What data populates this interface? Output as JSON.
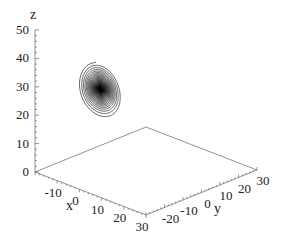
{
  "chart_data": {
    "type": "line3d",
    "title": "",
    "parameters": {
      "sigma": 10,
      "rho": 28,
      "beta": 2.6667
    },
    "axes": {
      "x": {
        "label": "x",
        "ticks": [
          "-10",
          "0",
          "10",
          "20",
          "30"
        ],
        "range": [
          -20,
          30
        ]
      },
      "y": {
        "label": "y",
        "ticks": [
          "-20",
          "-10",
          "0",
          "10",
          "20",
          "30"
        ],
        "range": [
          -30,
          30
        ]
      },
      "z": {
        "label": "z",
        "ticks": [
          "0",
          "10",
          "20",
          "30",
          "40",
          "50"
        ],
        "range": [
          0,
          50
        ]
      }
    },
    "grid": false,
    "legend": null,
    "line_color": "#1a1a1a"
  },
  "labels": {
    "x_axis": "x",
    "y_axis": "y",
    "z_axis": "z"
  }
}
